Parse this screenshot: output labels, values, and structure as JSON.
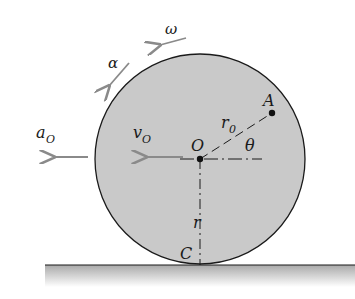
{
  "diagram": {
    "labels": {
      "omega": "ω",
      "alpha": "α",
      "a_O": "a",
      "a_O_sub": "O",
      "v_O": "v",
      "v_O_sub": "O",
      "center": "O",
      "point_A": "A",
      "r0": "r",
      "r0_sub": "0",
      "theta": "θ",
      "radius": "r",
      "contact": "C"
    },
    "colors": {
      "wheel_fill": "#c9c9c9",
      "outline": "#1a1a1a",
      "arrow": "#8a8a8a",
      "ground": "#b5b5b5"
    }
  }
}
